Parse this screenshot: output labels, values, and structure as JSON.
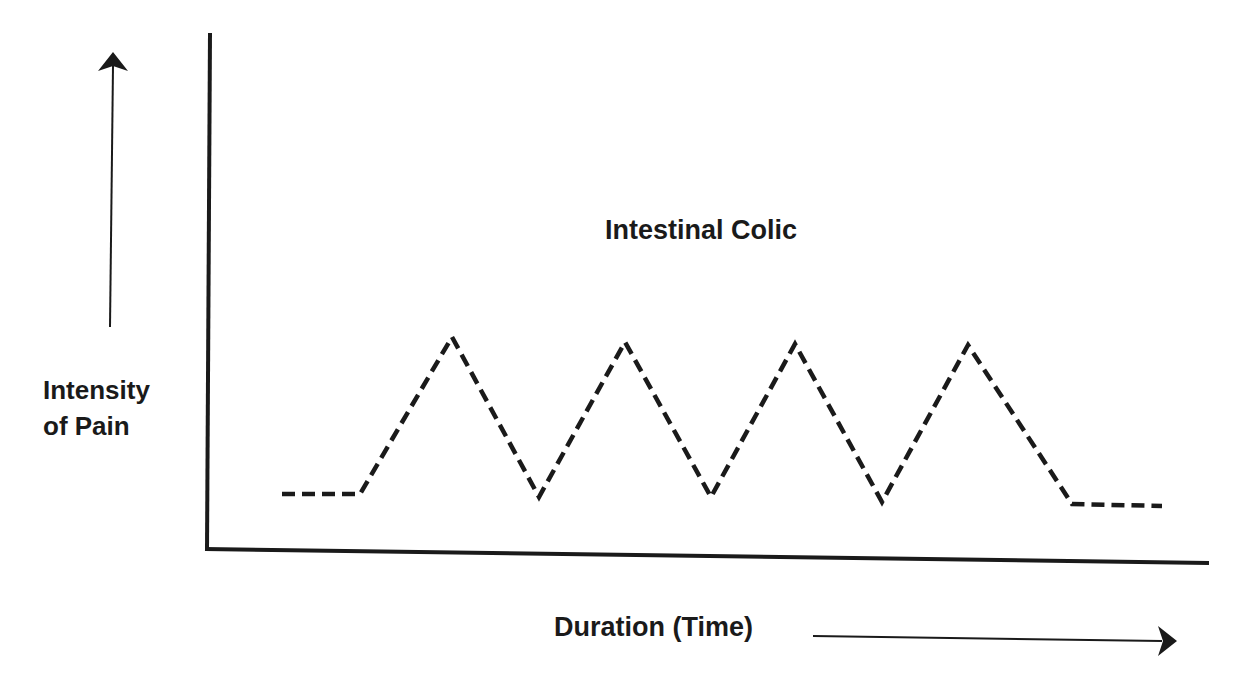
{
  "chart_data": {
    "type": "line",
    "title": "Intestinal Colic",
    "xlabel": "Duration (Time)",
    "ylabel": [
      "Intensity",
      "of Pain"
    ],
    "grid": false,
    "legend": null,
    "line_style": "dashed",
    "color": "#1a1a1a",
    "series": [
      {
        "name": "Intestinal Colic",
        "points_px": [
          [
            282,
            494
          ],
          [
            360,
            494
          ],
          [
            452,
            337
          ],
          [
            539,
            497
          ],
          [
            625,
            342
          ],
          [
            711,
            497
          ],
          [
            795,
            344
          ],
          [
            882,
            502
          ],
          [
            968,
            345
          ],
          [
            1072,
            504
          ],
          [
            1162,
            506
          ]
        ],
        "relative_values": [
          0.1,
          0.1,
          1.0,
          0.1,
          1.0,
          0.1,
          1.0,
          0.1,
          1.0,
          0.1,
          0.1
        ]
      }
    ]
  },
  "labels": {
    "title": "Intestinal Colic",
    "ylabel_line1": "Intensity",
    "ylabel_line2": "of Pain",
    "xlabel": "Duration (Time)"
  }
}
